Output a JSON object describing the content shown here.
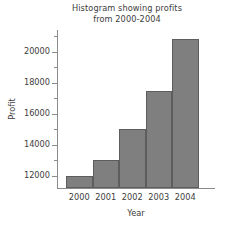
{
  "chart_data": {
    "type": "bar",
    "title": "Histogram showing profits from 2000-2004",
    "title_line1": "Histogram showing profits",
    "title_line2": "from 2000-2004",
    "xlabel": "Year",
    "ylabel": "Profit",
    "categories": [
      "2000",
      "2001",
      "2002",
      "2003",
      "2004"
    ],
    "values": [
      12000,
      13000,
      15000,
      17450,
      20800
    ],
    "ylim": [
      11200,
      21400
    ],
    "ymajor_ticks": [
      12000,
      14000,
      16000,
      18000,
      20000
    ],
    "ytick_labels": [
      "12000",
      "14000",
      "16000",
      "18000",
      "20000"
    ],
    "yminor_ticks": [
      13000,
      15000,
      17000,
      19000,
      21000
    ],
    "grid": false,
    "legend": null,
    "bar_color": "#7f7f7f",
    "bar_edge_color": "#5d5d5d",
    "axis_color": "#8b8b8b",
    "text_color": "#3d3d3d",
    "background": "#ffffff"
  }
}
